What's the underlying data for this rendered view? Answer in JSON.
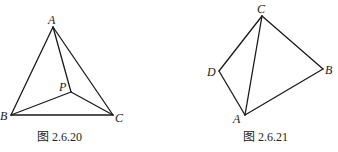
{
  "figures": [
    {
      "caption": "图 2.6.20",
      "points": {
        "A": {
          "label": "A",
          "x": 53,
          "y": 27
        },
        "B": {
          "label": "B",
          "x": 11,
          "y": 115
        },
        "C": {
          "label": "C",
          "x": 113,
          "y": 115
        },
        "P": {
          "label": "P",
          "x": 71,
          "y": 92
        }
      },
      "segments": [
        "AB",
        "AC",
        "BC",
        "AP",
        "BP",
        "CP"
      ]
    },
    {
      "caption": "图 2.6.21",
      "points": {
        "C": {
          "label": "C",
          "x": 262,
          "y": 16
        },
        "D": {
          "label": "D",
          "x": 219,
          "y": 71
        },
        "A": {
          "label": "A",
          "x": 245,
          "y": 115
        },
        "B": {
          "label": "B",
          "x": 323,
          "y": 69
        }
      },
      "segments": [
        "CD",
        "DA",
        "AB",
        "BC",
        "CA"
      ]
    }
  ]
}
